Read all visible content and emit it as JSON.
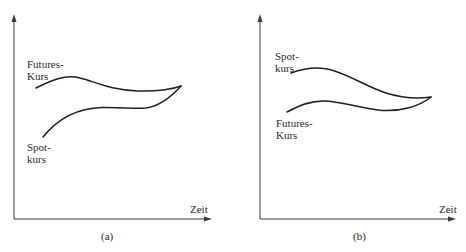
{
  "panels": [
    {
      "id": "a",
      "caption": "(a)",
      "x_axis_label": "Zeit",
      "upper_label": [
        "Futures-",
        "Kurs"
      ],
      "lower_label": [
        "Spot-",
        "kurs"
      ],
      "upper_curve": "Futures-Kurs",
      "lower_curve": "Spotkurs"
    },
    {
      "id": "b",
      "caption": "(b)",
      "x_axis_label": "Zeit",
      "upper_label": [
        "Spot-",
        "kurs"
      ],
      "lower_label": [
        "Futures-",
        "Kurs"
      ],
      "upper_curve": "Spotkurs",
      "lower_curve": "Futures-Kurs"
    }
  ],
  "colors": {
    "line": "#1f1f1f",
    "axis": "#3a3a3a",
    "text": "#2a2a2a",
    "background": "#ffffff"
  }
}
